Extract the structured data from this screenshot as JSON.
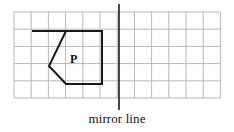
{
  "figure": {
    "background_color": "#ffffff"
  },
  "grid": {
    "name": "square-grid",
    "columns": 12,
    "rows": 5,
    "origin_x": 14,
    "origin_y": 12,
    "cell_size": 17.2,
    "line_color": "#b9b9b9",
    "line_width": 1
  },
  "mirror_line": {
    "label": "mirror line",
    "color": "#1a1a1a",
    "line_width": 1.6,
    "x": 119,
    "y_top": 4,
    "y_bottom": 110,
    "grid_column": 6
  },
  "shape": {
    "label": "P",
    "label_x": 70,
    "label_y": 61,
    "stroke_color": "#1a1a1a",
    "stroke_width": 2,
    "fill": "none",
    "points_px": "32,31 102,31 102,84 66,84 49,66 66,31",
    "vertices_grid": [
      {
        "col": 1,
        "row": 1
      },
      {
        "col": 5,
        "row": 1
      },
      {
        "col": 5,
        "row": 4
      },
      {
        "col": 3,
        "row": 4
      },
      {
        "col": 2,
        "row": 3
      },
      {
        "col": 3,
        "row": 1
      }
    ]
  },
  "chart_data": {
    "type": "diagram",
    "grid": {
      "columns": 12,
      "rows": 5,
      "visible": true
    },
    "annotations": [
      "P",
      "mirror line"
    ],
    "shape_vertices": [
      [
        1,
        1
      ],
      [
        5,
        1
      ],
      [
        5,
        4
      ],
      [
        3,
        4
      ],
      [
        2,
        3
      ],
      [
        3,
        1
      ]
    ],
    "mirror_line_column": 6
  }
}
